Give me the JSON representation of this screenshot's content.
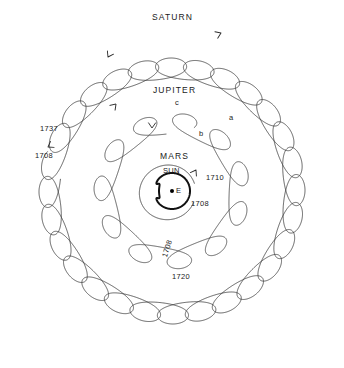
{
  "figure": {
    "background_color": "#ffffff",
    "line_color": "#3a3a3a",
    "emphasis_color": "#111111",
    "width": 344,
    "height": 368
  },
  "center_body": {
    "label": "E",
    "name": "Earth",
    "x": 172,
    "y": 191
  },
  "labels": {
    "saturn": "SATURN",
    "jupiter": "JUPITER",
    "mars": "MARS",
    "sun": "SUN",
    "earth": "E"
  },
  "year_marks": [
    {
      "name": "saturn-start",
      "text": "1737",
      "x": 40,
      "y": 125,
      "rotation": 0
    },
    {
      "name": "saturn-end",
      "text": "1708",
      "x": 35,
      "y": 152,
      "rotation": 0
    },
    {
      "name": "jupiter-start",
      "text": "1708",
      "x": 161,
      "y": 256,
      "rotation": -72
    },
    {
      "name": "jupiter-end",
      "text": "1720",
      "x": 172,
      "y": 273,
      "rotation": 0
    },
    {
      "name": "mars-start",
      "text": "1710",
      "x": 206,
      "y": 174,
      "rotation": 0
    },
    {
      "name": "mars-end",
      "text": "1708",
      "x": 191,
      "y": 200,
      "rotation": 0
    }
  ],
  "loop_marks": [
    {
      "name": "jupiter-loop-c",
      "text": "c",
      "x": 175,
      "y": 99
    },
    {
      "name": "jupiter-loop-b",
      "text": "b",
      "x": 199,
      "y": 130
    },
    {
      "name": "jupiter-loop-a",
      "text": "a",
      "x": 229,
      "y": 114
    }
  ],
  "orbits": [
    {
      "name": "sun",
      "type": "circle-with-cusp",
      "center_x": 172,
      "center_y": 191,
      "radius": 18,
      "loops": 1,
      "stroke_width": 2.0,
      "label": "SUN"
    },
    {
      "name": "mars",
      "type": "epicycloid",
      "center_x": 172,
      "center_y": 191,
      "radius": 33,
      "loops": 1,
      "loop_size": 9,
      "gap_degrees": 34,
      "start_angle_deg": 18,
      "label": "MARS"
    },
    {
      "name": "jupiter",
      "type": "epicycloid",
      "center_x": 172,
      "center_y": 191,
      "radius": 78,
      "loops": 11,
      "loop_size": 20,
      "gap_degrees": 8,
      "start_angle_deg": 96,
      "label": "JUPITER"
    },
    {
      "name": "saturn",
      "type": "epicycloid",
      "center_x": 172,
      "center_y": 191,
      "radius": 133,
      "loops": 28,
      "loop_size": 20,
      "gap_degrees": 5,
      "start_angle_deg": 174,
      "label": "SATURN"
    }
  ],
  "arrows": [
    {
      "name": "saturn-direction-arrow",
      "x": 221,
      "y": 33,
      "angle_deg": -22
    },
    {
      "name": "jupiter-direction-arrow-left",
      "x": 116,
      "y": 104,
      "angle_deg": -46
    },
    {
      "name": "jupiter-direction-arrow-loop",
      "x": 152,
      "y": 128,
      "angle_deg": 92
    },
    {
      "name": "saturn-direction-arrow-loop",
      "x": 108,
      "y": 57,
      "angle_deg": 120
    },
    {
      "name": "mars-direction-arrow",
      "x": 196,
      "y": 170,
      "angle_deg": -58
    },
    {
      "name": "saturn-end-arrow",
      "x": 48,
      "y": 147,
      "angle_deg": 150
    }
  ]
}
